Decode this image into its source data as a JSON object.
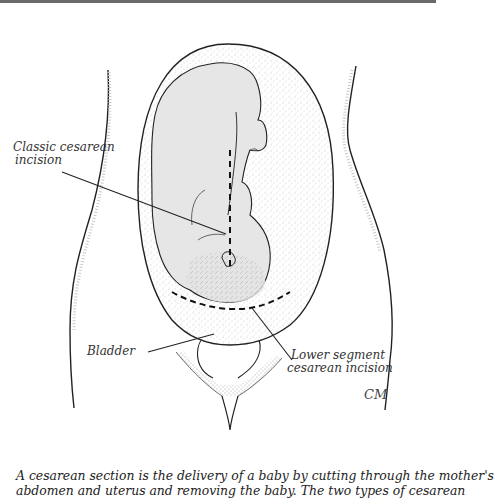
{
  "figure": {
    "labels": {
      "classic_line1": "Classic cesarean",
      "classic_line2": "incision",
      "bladder": "Bladder",
      "lower_line1": "Lower segment",
      "lower_line2": "cesarean incision"
    },
    "signature": "CM"
  },
  "caption": {
    "line1": "A cesarean section is the delivery of a baby by cutting through the mother's",
    "line2": "abdomen and uterus and removing the baby. The two types of cesarean"
  },
  "colors": {
    "ink": "#1a1a1a",
    "fetus_fill": "#e6e6e6",
    "stipple": "#9a9a9a",
    "rule": "#6a6a6a"
  }
}
